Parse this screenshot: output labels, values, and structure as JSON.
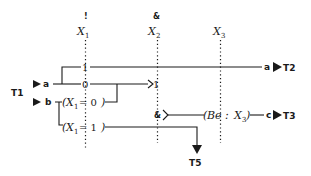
{
  "diagram": {
    "variables": [
      {
        "name": "X",
        "sub": "1",
        "marker": "!"
      },
      {
        "name": "X",
        "sub": "2",
        "marker": "&"
      },
      {
        "name": "X",
        "sub": "3",
        "marker": ""
      }
    ],
    "inputs": {
      "terminal": "T1",
      "a_label": "a",
      "b_label": "b"
    },
    "branch_values": {
      "one": "1",
      "zero": "0",
      "join_one": "1",
      "and_marker": "&"
    },
    "conditions": [
      {
        "var": "X",
        "sub": "1",
        "text": " = 0"
      },
      {
        "var": "X",
        "sub": "1",
        "text": " = 1"
      }
    ],
    "behaviour": {
      "prefix": "Be : ",
      "var": "X",
      "sub": "3"
    },
    "outputs": [
      {
        "signal": "a",
        "terminal": "T2"
      },
      {
        "signal": "c",
        "terminal": "T3"
      },
      {
        "signal": "",
        "terminal": "T5"
      }
    ]
  }
}
